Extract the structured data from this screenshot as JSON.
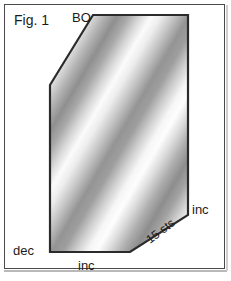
{
  "figure": {
    "title": "Fig. 1",
    "type": "knitting-schematic",
    "shape": {
      "name": "beveled-hexagon-panel",
      "vertices": [
        [
          93,
          15
        ],
        [
          188,
          15
        ],
        [
          188,
          215
        ],
        [
          130,
          252
        ],
        [
          50,
          252
        ],
        [
          50,
          85
        ]
      ]
    },
    "fill": {
      "style": "repeating-diagonal-gradient",
      "angle_deg": 45,
      "band_period_px": 46,
      "light_color": "#fcfcfc",
      "mid_color": "#bfbfbf",
      "dark_color": "#8e8e8e"
    },
    "outline_color": "#2b2b2b",
    "frame_color": "#4a4a4a",
    "background_color": "#ffffff",
    "text_color": "#1b1b1b"
  },
  "labels": {
    "title": "Fig. 1",
    "bind_off": "BO",
    "decrease": "dec",
    "increase_bottom": "inc",
    "increase_right": "inc",
    "stitch_count": "15 sts"
  }
}
